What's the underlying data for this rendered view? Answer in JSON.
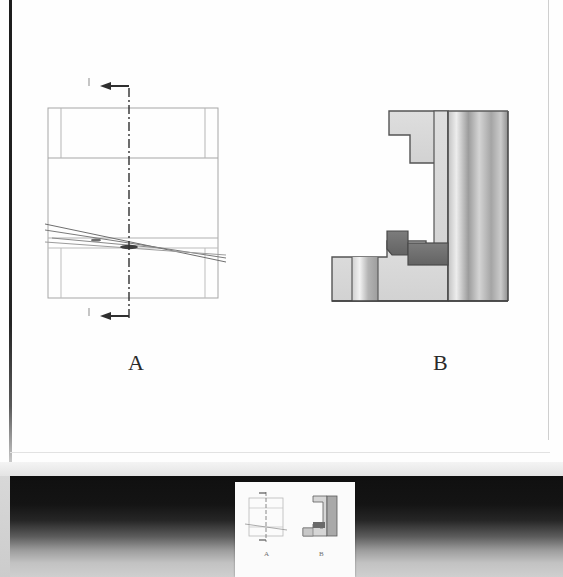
{
  "slide": {
    "background_color": "#fefefe",
    "figures": [
      {
        "id": "figure-a",
        "caption": "A",
        "kind": "orthographic-section-drawing",
        "description": "Front view of a stepped part with a vertical dash-dot cutting-plane line and section arrows at top and bottom, plus diagonal break/section lines through the lower band",
        "line_color": "#9a9a9a",
        "center_line_color": "#3a3a3a"
      },
      {
        "id": "figure-b",
        "caption": "B",
        "kind": "shaded-3d-solid",
        "description": "Rendered three-dimensional C-shaped machined bracket with a notch at the upper arm, a stepped base and a cylindrical shaded column at the right",
        "body_color": "#d8d8d8",
        "dark_detail_color": "#6d6d6d",
        "outline_color": "#4a4a4a"
      }
    ]
  },
  "captions": {
    "figure_a_label": "A",
    "figure_b_label": "B"
  },
  "bottom_band": {
    "kind": "film-strip-gradient",
    "dark_color": "#121212",
    "light_color": "#cfcfcf",
    "thumbnail": {
      "label": "slide-thumbnail",
      "background_color": "#fbfbfb",
      "contains": "miniature copy of figures A and B with their captions"
    }
  },
  "colors": {
    "paper": "#fefefe",
    "frame": "#1d1d1d",
    "drawing_line": "#9a9a9a",
    "solid_fill": "#d8d8d8",
    "solid_dark": "#6d6d6d",
    "caption_text": "#2a2a2a"
  }
}
